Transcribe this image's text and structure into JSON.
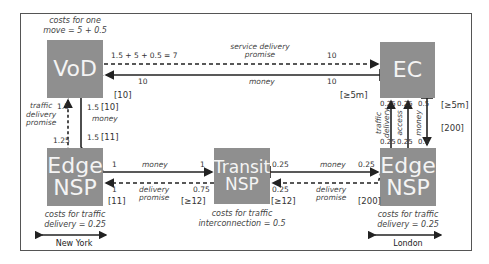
{
  "nodes": {
    "vod": {
      "label": "VoD",
      "caption_line1": "costs for one",
      "caption_line2": "move = 5 + 0.5"
    },
    "ec": {
      "label": "EC"
    },
    "edge_ny": {
      "label_line1": "Edge",
      "label_line2": "NSP",
      "caption_line1": "costs for traffic",
      "caption_line2": "delivery = 0.25",
      "city": "New York"
    },
    "transit": {
      "label_line1": "Transit",
      "label_line2": "NSP",
      "caption_line1": "costs for traffic",
      "caption_line2": "interconnection = 0.5"
    },
    "edge_london": {
      "label_line1": "Edge",
      "label_line2": "NSP",
      "caption_line1": "costs for traffic",
      "caption_line2": "delivery = 0.25",
      "city": "London"
    }
  },
  "edges": {
    "vod_ec_promise": {
      "label_line1": "service delivery",
      "label_line2": "promise",
      "value_left": "1.5 + 5 + 0.5 = 7",
      "value_right": "10"
    },
    "ec_vod_money": {
      "label": "money",
      "value_left": "10",
      "value_right": "10",
      "bracket_left": "[10]",
      "bracket_right": "[≥5m]"
    },
    "vod_edge_promise": {
      "label_line1": "traffic",
      "label_line2": "delivery",
      "label_line3": "promise",
      "value_top": "1.5",
      "value_bottom": "1.25"
    },
    "vod_edge_money": {
      "label": "money",
      "value_top": "1.5",
      "bracket_top": "[10]",
      "value_bottom": "1.5",
      "bracket_bottom": "[11]"
    },
    "edge_transit_money": {
      "label": "money",
      "value_left": "1",
      "value_right": "1"
    },
    "transit_edge_promise": {
      "label_line1": "delivery",
      "label_line2": "promise",
      "value_left": "1",
      "value_right": "0.75",
      "bracket_left": "[11]",
      "bracket_right": "[≥12]"
    },
    "transit_london_money": {
      "label": "money",
      "value_left": "0.25",
      "value_right": "0.25"
    },
    "london_transit_promise": {
      "label_line1": "delivery",
      "label_line2": "promise",
      "value_left": "0.25",
      "bracket_left": "[≥12]",
      "bracket_right": "[200]"
    },
    "london_ec_traffic": {
      "label_line1": "traffic",
      "label_line2": "delivery",
      "value_top": "0.25",
      "value_bottom": "0.25"
    },
    "london_ec_access": {
      "label": "access",
      "value_top": "0.25",
      "value_bottom": "0.25"
    },
    "ec_london_money": {
      "label": "money",
      "value_top": "0.5",
      "value_bottom": "0.5",
      "bracket_top": "[≥5m]",
      "bracket_bottom": "[200]"
    }
  },
  "colors": {
    "box": "#8f8f8f",
    "box_text": "#f4f4f4",
    "line": "#222222"
  }
}
